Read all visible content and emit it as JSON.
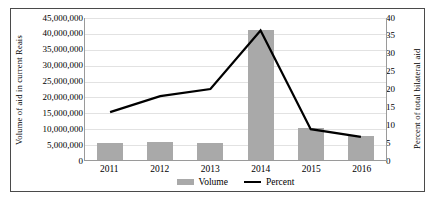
{
  "chart_data": {
    "type": "bar",
    "title": "",
    "xlabel": "",
    "ylabel": "Volume of aid in current Reais",
    "y2label": "Percent of total bilateral aid",
    "categories": [
      "2011",
      "2012",
      "2013",
      "2014",
      "2015",
      "2016"
    ],
    "grid": true,
    "legend_position": "bottom",
    "ylim": [
      0,
      45000000
    ],
    "y2lim": [
      0,
      40
    ],
    "yticks": [
      0,
      5000000,
      10000000,
      15000000,
      20000000,
      25000000,
      30000000,
      35000000,
      40000000,
      45000000
    ],
    "ytick_labels": [
      "0",
      "5,000,000",
      "10,000,000",
      "15,000,000",
      "20,000,000",
      "25,000,000",
      "30,000,000",
      "35,000,000",
      "40,000,000",
      "45,000,000"
    ],
    "y2ticks": [
      0,
      5,
      10,
      15,
      20,
      25,
      30,
      35,
      40
    ],
    "y2tick_labels": [
      "0",
      "5",
      "10",
      "15",
      "20",
      "25",
      "30",
      "35",
      "40"
    ],
    "series": [
      {
        "name": "Volume",
        "type": "bar",
        "axis": "left",
        "color": "#a9a9a9",
        "values": [
          5300000,
          5800000,
          5500000,
          41000000,
          10000000,
          7500000
        ]
      },
      {
        "name": "Percent",
        "type": "line",
        "axis": "right",
        "color": "#000000",
        "values": [
          13.5,
          18.0,
          20.0,
          36.5,
          8.7,
          6.5
        ]
      }
    ]
  },
  "legend": {
    "items": [
      {
        "label": "Volume",
        "marker": "bar-swatch",
        "color": "#a9a9a9"
      },
      {
        "label": "Percent",
        "marker": "line-swatch",
        "color": "#000000"
      }
    ]
  }
}
